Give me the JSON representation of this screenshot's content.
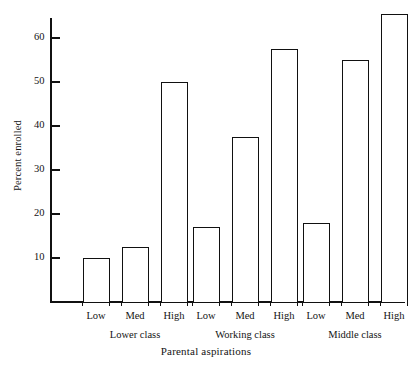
{
  "chart_data": {
    "type": "bar",
    "title": "",
    "xlabel": "Parental aspirations",
    "ylabel": "Percent enrolled",
    "ylim": [
      0,
      68
    ],
    "yticks": [
      10,
      20,
      30,
      40,
      50,
      60
    ],
    "ytick_labels": [
      "10",
      "20",
      "30",
      "40",
      "50",
      "60"
    ],
    "grid": false,
    "legend": "none",
    "groups": [
      {
        "name": "Lower class",
        "categories": [
          "Low",
          "Med",
          "High"
        ],
        "values": [
          10,
          12.5,
          50
        ]
      },
      {
        "name": "Working class",
        "categories": [
          "Low",
          "Med",
          "High"
        ],
        "values": [
          17,
          37.5,
          57.5
        ]
      },
      {
        "name": "Middle class",
        "categories": [
          "Low",
          "Med",
          "High"
        ],
        "values": [
          18,
          55,
          65.5
        ]
      }
    ],
    "categories": [
      "Low",
      "Med",
      "High"
    ],
    "series": [
      {
        "name": "Lower class",
        "values": [
          10,
          12.5,
          50
        ]
      },
      {
        "name": "Working class",
        "values": [
          17,
          37.5,
          57.5
        ]
      },
      {
        "name": "Middle class",
        "values": [
          18,
          55,
          65.5
        ]
      }
    ],
    "bar_style": {
      "fill": "#ffffff",
      "edge": "#111111",
      "edge_width_px": 1.5
    },
    "axis_color": "#111111",
    "text_color": "#141414",
    "background": "#ffffff"
  }
}
